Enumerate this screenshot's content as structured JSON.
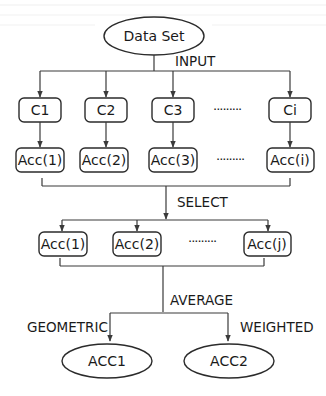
{
  "diagram": {
    "root": {
      "label": "Data Set"
    },
    "edge_labels": {
      "input": "INPUT",
      "select": "SELECT",
      "average": "AVERAGE",
      "geometric": "GEOMETRIC",
      "weighted": "WEIGHTED"
    },
    "classifiers": [
      {
        "label": "C1"
      },
      {
        "label": "C2"
      },
      {
        "label": "C3"
      },
      {
        "label": "Ci"
      }
    ],
    "accuracies": [
      {
        "label": "Acc(1)"
      },
      {
        "label": "Acc(2)"
      },
      {
        "label": "Acc(3)"
      },
      {
        "label": "Acc(i)"
      }
    ],
    "selected": [
      {
        "label": "Acc(1)"
      },
      {
        "label": "Acc(2)"
      },
      {
        "label": "Acc(j)"
      }
    ],
    "outputs": [
      {
        "label": "ACC1"
      },
      {
        "label": "ACC2"
      }
    ],
    "ellipsis": "·········",
    "colors": {
      "stroke": "#2b2b2b",
      "text": "#1a1a1a",
      "background": "#ffffff"
    }
  }
}
